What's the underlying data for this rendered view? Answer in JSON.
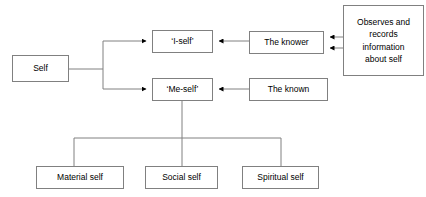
{
  "diagram": {
    "colors": {
      "background": "#ffffff",
      "box_border": "#808080",
      "box_fill": "#ffffff",
      "connector": "#808080",
      "arrowhead": "#000000",
      "text": "#000000"
    },
    "nodes": [
      {
        "id": "self",
        "label": "Self",
        "x": 12,
        "y": 55,
        "w": 57,
        "h": 27
      },
      {
        "id": "i-self",
        "label": "‘I-self’",
        "x": 152,
        "y": 30,
        "w": 61,
        "h": 23
      },
      {
        "id": "me-self",
        "label": "‘Me-self’",
        "x": 152,
        "y": 78,
        "w": 61,
        "h": 23
      },
      {
        "id": "the-knower",
        "label": "The knower",
        "x": 249,
        "y": 31,
        "w": 75,
        "h": 23
      },
      {
        "id": "the-known",
        "label": "The known",
        "x": 249,
        "y": 78,
        "w": 79,
        "h": 23
      },
      {
        "id": "observes-records",
        "label": "Observes and\nrecords\ninformation\nabout self",
        "x": 343,
        "y": 5,
        "w": 81,
        "h": 71
      },
      {
        "id": "material-self",
        "label": "Material self",
        "x": 36,
        "y": 166,
        "w": 88,
        "h": 23
      },
      {
        "id": "social-self",
        "label": "Social self",
        "x": 145,
        "y": 166,
        "w": 73,
        "h": 23
      },
      {
        "id": "spiritual-self",
        "label": "Spiritual self",
        "x": 242,
        "y": 166,
        "w": 77,
        "h": 23
      }
    ],
    "edges": [
      {
        "id": "self-to-branch",
        "from": "self",
        "to": "branch-point",
        "arrow": false
      },
      {
        "id": "branch-to-i-self",
        "from": "branch-point",
        "to": "i-self",
        "arrow": true
      },
      {
        "id": "branch-to-me-self",
        "from": "branch-point",
        "to": "me-self",
        "arrow": true
      },
      {
        "id": "knower-to-i-self",
        "from": "the-knower",
        "to": "i-self",
        "arrow": true
      },
      {
        "id": "known-to-me-self",
        "from": "the-known",
        "to": "me-self",
        "arrow": true
      },
      {
        "id": "observes-to-knower-upper",
        "from": "observes-records",
        "to": "the-knower",
        "arrow": true
      },
      {
        "id": "observes-to-knower-lower",
        "from": "observes-records",
        "to": "the-knower",
        "arrow": true
      },
      {
        "id": "me-self-to-material-self",
        "from": "me-self",
        "to": "material-self",
        "arrow": false
      },
      {
        "id": "me-self-to-social-self",
        "from": "me-self",
        "to": "social-self",
        "arrow": false
      },
      {
        "id": "me-self-to-spiritual-self",
        "from": "me-self",
        "to": "spiritual-self",
        "arrow": false
      }
    ]
  }
}
